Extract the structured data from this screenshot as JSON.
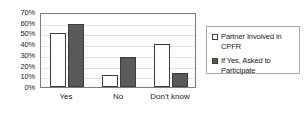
{
  "chart_data": {
    "type": "bar",
    "title": "",
    "xlabel": "",
    "ylabel": "",
    "categories": [
      "Yes",
      "No",
      "Don't know"
    ],
    "series": [
      {
        "name": "Partner Involved in CPFR",
        "color": "#ffffff",
        "values": [
          50,
          11,
          40
        ]
      },
      {
        "name": "If Yes, Asked to Participate",
        "color": "#595959",
        "values": [
          59,
          28,
          13
        ]
      }
    ],
    "ylim": [
      0,
      70
    ],
    "ytick_values": [
      0,
      10,
      20,
      30,
      40,
      50,
      60,
      70
    ],
    "ytick_labels": [
      "0%",
      "10%",
      "20%",
      "30%",
      "40%",
      "50%",
      "60%",
      "70%"
    ],
    "grid": true,
    "grid_axis": "y",
    "legend_position": "right"
  }
}
